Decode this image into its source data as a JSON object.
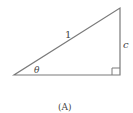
{
  "diagram": {
    "type": "right-triangle",
    "labels": {
      "hypotenuse": "1",
      "opposite": "c",
      "angle": "θ",
      "caption": "(A)"
    },
    "colors": {
      "stroke": "#7a7a7a",
      "text": "#444444",
      "background": "#ffffff"
    }
  }
}
